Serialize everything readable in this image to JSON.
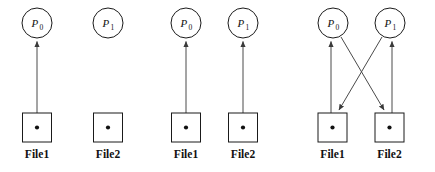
{
  "figure": {
    "type": "diagram",
    "colors": {
      "background": "#ffffff",
      "stroke": "#1a1a1a",
      "edge": "#4a4a4a",
      "dot": "#111111",
      "text": "#111111"
    },
    "geometry": {
      "circle_radius": 15,
      "circle_center_y": 23,
      "box_size": 29,
      "box_top_y": 113,
      "file_label_y": 158
    },
    "panels": [
      {
        "id": "panel-1",
        "processes": [
          {
            "id": "p0",
            "name": "P",
            "subscript": "0",
            "cx": 37
          },
          {
            "id": "p1",
            "name": "P",
            "subscript": "1",
            "cx": 108
          }
        ],
        "files": [
          {
            "id": "file1",
            "label": "File1",
            "cx": 37
          },
          {
            "id": "file2",
            "label": "File2",
            "cx": 108
          }
        ],
        "edges": [
          {
            "id": "edge-file1-to-p0",
            "from": "file1",
            "to": "p0",
            "direction": "up",
            "kind": "vertical"
          }
        ]
      },
      {
        "id": "panel-2",
        "processes": [
          {
            "id": "p0",
            "name": "P",
            "subscript": "0",
            "cx": 186
          },
          {
            "id": "p1",
            "name": "P",
            "subscript": "1",
            "cx": 243
          }
        ],
        "files": [
          {
            "id": "file1",
            "label": "File1",
            "cx": 186
          },
          {
            "id": "file2",
            "label": "File2",
            "cx": 243
          }
        ],
        "edges": [
          {
            "id": "edge-file1-to-p0",
            "from": "file1",
            "to": "p0",
            "direction": "up",
            "kind": "vertical"
          },
          {
            "id": "edge-file2-to-p1",
            "from": "file2",
            "to": "p1",
            "direction": "up",
            "kind": "vertical"
          }
        ]
      },
      {
        "id": "panel-3",
        "processes": [
          {
            "id": "p0",
            "name": "P",
            "subscript": "0",
            "cx": 333
          },
          {
            "id": "p1",
            "name": "P",
            "subscript": "1",
            "cx": 390
          }
        ],
        "files": [
          {
            "id": "file1",
            "label": "File1",
            "cx": 333
          },
          {
            "id": "file2",
            "label": "File2",
            "cx": 390
          }
        ],
        "edges": [
          {
            "id": "edge-file1-to-p0",
            "from": "file1",
            "to": "p0",
            "direction": "up",
            "kind": "vertical"
          },
          {
            "id": "edge-file2-to-p1",
            "from": "file2",
            "to": "p1",
            "direction": "up",
            "kind": "vertical"
          },
          {
            "id": "edge-p1-to-file1",
            "from": "p1",
            "to": "file1",
            "direction": "down",
            "kind": "diagonal"
          },
          {
            "id": "edge-p0-to-file2",
            "from": "p0",
            "to": "file2",
            "direction": "down",
            "kind": "diagonal"
          }
        ]
      }
    ]
  }
}
